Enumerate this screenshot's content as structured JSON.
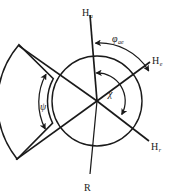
{
  "figure": {
    "kind": "vector-angle-diagram",
    "width": 177,
    "height": 196,
    "background_color": "#ffffff",
    "line_color": "#1a1a1a",
    "text_color": "#1a1a1a"
  },
  "labels": {
    "h_a": {
      "base": "H",
      "sub": "a"
    },
    "h_e": {
      "base": "H",
      "sub": "e"
    },
    "h_r": {
      "base": "H",
      "sub": "r"
    },
    "r": {
      "base": "R",
      "sub": ""
    },
    "phi_ae": {
      "base": "φ",
      "sub": "ae"
    },
    "chi": {
      "base": "χ",
      "sub": ""
    },
    "psi": {
      "base": "ψ",
      "sub": ""
    }
  },
  "geometry": {
    "circle": {
      "cx": 97,
      "cy": 101,
      "r": 45
    },
    "spokes": [
      {
        "name": "h-a-spoke",
        "label_key": "h_a",
        "angle_deg": 90,
        "tip_x": 89,
        "tip_y": 14
      },
      {
        "name": "h-e-spoke",
        "label_key": "h_e",
        "angle_deg": 28,
        "tip_x": 150,
        "tip_y": 62
      },
      {
        "name": "h-r-spoke",
        "label_key": "h_r",
        "angle_deg": -28,
        "tip_x": 149,
        "tip_y": 141
      },
      {
        "name": "r-spoke",
        "label_key": "r",
        "angle_deg": -90,
        "tip_x": 89,
        "tip_y": 175
      }
    ],
    "sector": {
      "name": "annular-sector",
      "inner_radius": 48,
      "outer_radius": 90,
      "start_angle_deg": 152,
      "end_angle_deg": 208
    },
    "angle_arcs": [
      {
        "name": "phi-ae-arc",
        "label_key": "phi_ae",
        "radius": 58,
        "from_deg": 90,
        "to_deg": 28,
        "double_headed": true
      },
      {
        "name": "chi-arc",
        "label_key": "chi",
        "radius": 28,
        "from_deg": 90,
        "to_deg": 28,
        "double_headed": true
      },
      {
        "name": "psi-arc",
        "label_key": "psi",
        "radius": 58,
        "from_deg": 152,
        "to_deg": 208,
        "double_headed": true
      }
    ]
  }
}
